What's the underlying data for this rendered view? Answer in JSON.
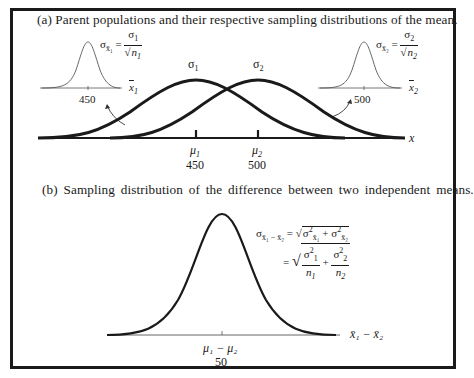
{
  "panel_a": {
    "caption": "(a)  Parent populations and their respective sampling distributions of the mean.",
    "axis_label": "x",
    "parent_1": {
      "sigma_label": "σ",
      "sigma_sub": "1",
      "mean_symbol": "μ",
      "mean_sub": "1",
      "mean_value": "450"
    },
    "parent_2": {
      "sigma_label": "σ",
      "sigma_sub": "2",
      "mean_symbol": "μ",
      "mean_sub": "2",
      "mean_value": "500"
    },
    "inset_1": {
      "formula_lhs": "σ",
      "formula_lhs_sub": "x̄₁",
      "equals": "=",
      "numerator": "σ",
      "numerator_sub": "1",
      "denominator": "n",
      "denominator_sub": "1",
      "center_value": "450",
      "axis_label": "x",
      "axis_sub": "1"
    },
    "inset_2": {
      "formula_lhs": "σ",
      "formula_lhs_sub": "x̄₂",
      "equals": "=",
      "numerator": "σ",
      "numerator_sub": "2",
      "denominator": "n",
      "denominator_sub": "2",
      "center_value": "500",
      "axis_label": "x",
      "axis_sub": "2"
    }
  },
  "panel_b": {
    "caption": "(b)  Sampling distribution of the difference between two independent means.",
    "formula_line1": {
      "lhs": "σ",
      "lhs_sub": "x̄₁ − x̄₂",
      "equals": "=",
      "term1": "σ",
      "term1_sub": "x̄₁",
      "term1_sup": "2",
      "plus": "+",
      "term2": "σ",
      "term2_sub": "x̄₂",
      "term2_sup": "2"
    },
    "formula_line2": {
      "equals": "=",
      "num1": "σ",
      "num1_sub": "1",
      "num1_sup": "2",
      "den1": "n",
      "den1_sub": "1",
      "plus": "+",
      "num2": "σ",
      "num2_sub": "2",
      "num2_sup": "2",
      "den2": "n",
      "den2_sub": "2"
    },
    "axis_label": "x̄₁ − x̄₂",
    "center_label": "μ₁ − μ₂",
    "center_value": "50"
  },
  "colors": {
    "ink": "#1a1a1a",
    "thin_ink": "#555555",
    "background": "#ffffff"
  }
}
